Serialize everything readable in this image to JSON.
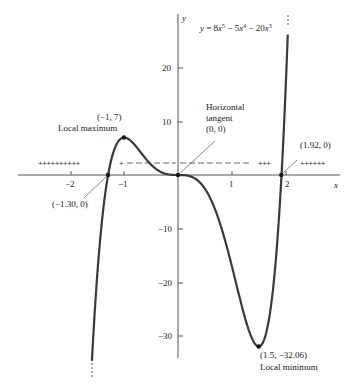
{
  "chart_data": {
    "type": "line",
    "equation_label": {
      "prefix": "y = 8x",
      "e1": "5",
      "mid1": " − 5x",
      "e2": "4",
      "mid2": " − 20x",
      "e3": "3"
    },
    "xlabel": "x",
    "ylabel": "y",
    "xlim": [
      -3.0,
      3.2
    ],
    "ylim": [
      -35,
      30
    ],
    "grid": false,
    "x_ticks": [
      {
        "value": -2,
        "label": "−2"
      },
      {
        "value": -1,
        "label": "−1"
      },
      {
        "value": 1,
        "label": "1"
      },
      {
        "value": 2,
        "label": "2"
      }
    ],
    "y_ticks": [
      {
        "value": 20,
        "label": "20"
      },
      {
        "value": 10,
        "label": "10"
      },
      {
        "value": -10,
        "label": "−10"
      },
      {
        "value": -20,
        "label": "−20"
      },
      {
        "value": -30,
        "label": "−30"
      }
    ],
    "series": [
      {
        "name": "y = 8x^5 - 5x^4 - 20x^3",
        "x_range": [
          -1.6,
          2.04
        ],
        "coefficients": {
          "x5": 8,
          "x4": -5,
          "x3": -20
        }
      }
    ],
    "key_points": [
      {
        "x": -1,
        "y": 7,
        "coord_label": "(−1, 7)",
        "desc": "Local maximum"
      },
      {
        "x": 0,
        "y": 0,
        "coord_label": "(0, 0)",
        "desc_lines": [
          "Horizontal",
          "tangent"
        ]
      },
      {
        "x": 1.5,
        "y": -32.06,
        "coord_label": "(1.5, −32.06)",
        "desc": "Local minimum"
      },
      {
        "x": -1.3,
        "y": 0,
        "coord_label": "(−1.30, 0)"
      },
      {
        "x": 1.92,
        "y": 0,
        "coord_label": "(1.92, 0)"
      }
    ],
    "sign_chart": {
      "segments": [
        {
          "interval": "(-inf, -1.30)",
          "signs": "++++++++++"
        },
        {
          "interval": "(-1.30, 0)",
          "signs": "+ - - - - -"
        },
        {
          "interval": "(0, 1.92)",
          "signs": "− − − − − − − −   +++"
        },
        {
          "interval": "(1.92, inf)",
          "signs": "++++++"
        }
      ]
    }
  }
}
